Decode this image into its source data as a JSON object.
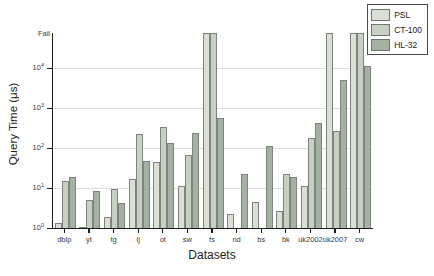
{
  "chart_data": {
    "type": "bar",
    "title": "",
    "xlabel": "Datasets",
    "ylabel": "Query Time (μs)",
    "yscale": "log",
    "ylim": [
      1,
      75000
    ],
    "fail_label": "Fail",
    "grid": "horizontal-major",
    "legend_position": "top-right",
    "yticks": [
      {
        "base": "10",
        "exp": "0",
        "log_value": 0
      },
      {
        "base": "10",
        "exp": "1",
        "log_value": 1
      },
      {
        "base": "10",
        "exp": "2",
        "log_value": 2
      },
      {
        "base": "10",
        "exp": "3",
        "log_value": 3
      },
      {
        "base": "10",
        "exp": "4",
        "log_value": 4
      }
    ],
    "categories": [
      "dblp",
      "yt",
      "tg",
      "lj",
      "ot",
      "sw",
      "fs",
      "nd",
      "bs",
      "bk",
      "uk2002",
      "uk2007",
      "cw"
    ],
    "series": [
      {
        "name": "PSL",
        "color": "#dae0d5",
        "values": [
          1.3,
          1.05,
          1.9,
          17,
          45,
          11,
          "fail",
          2.3,
          4.6,
          2.6,
          11,
          "fail",
          "fail"
        ]
      },
      {
        "name": "CT-100",
        "color": "#c7d1c3",
        "values": [
          15,
          5,
          9.5,
          220,
          330,
          65,
          "fail",
          null,
          null,
          23,
          180,
          270,
          "fail"
        ]
      },
      {
        "name": "HL-32",
        "color": "#a4b2a1",
        "values": [
          19,
          8.5,
          4.2,
          48,
          130,
          240,
          560,
          23,
          110,
          19,
          420,
          5000,
          11500
        ]
      }
    ]
  }
}
